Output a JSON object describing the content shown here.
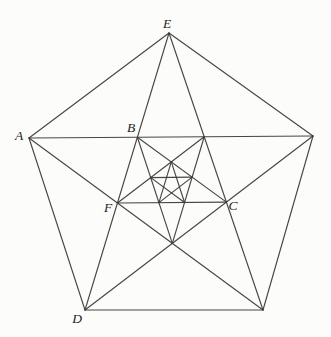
{
  "figure": {
    "background": "#fcfcfb",
    "line_color": "#3a3a3a",
    "label_color": "#1e1e1e"
  },
  "diagram": {
    "type": "nested-pentagram",
    "pentagram_levels": 3,
    "outer_pentagon": {
      "vertices": [
        {
          "label": "E",
          "x": 169,
          "y": 33
        },
        {
          "label": "",
          "x": 313,
          "y": 136
        },
        {
          "label": "",
          "x": 263,
          "y": 310
        },
        {
          "label": "D",
          "x": 85,
          "y": 310
        },
        {
          "label": "A",
          "x": 29,
          "y": 138
        }
      ]
    },
    "labels": [
      {
        "text": "E",
        "x": 167,
        "y": 32
      },
      {
        "text": "A",
        "x": 19,
        "y": 144
      },
      {
        "text": "B",
        "x": 131,
        "y": 136
      },
      {
        "text": "F",
        "x": 108,
        "y": 216
      },
      {
        "text": "C",
        "x": 233,
        "y": 214
      },
      {
        "text": "D",
        "x": 77,
        "y": 327
      }
    ]
  }
}
